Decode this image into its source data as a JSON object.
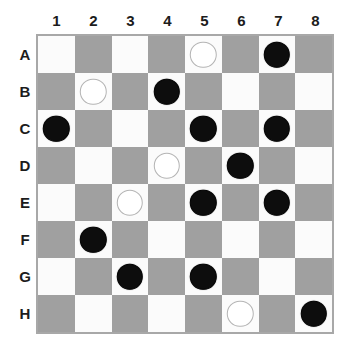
{
  "board": {
    "title": "Checkers Board",
    "column_labels": [
      "1",
      "2",
      "3",
      "4",
      "5",
      "6",
      "7",
      "8"
    ],
    "row_labels": [
      "A",
      "B",
      "C",
      "D",
      "E",
      "F",
      "G",
      "H"
    ],
    "size": 8,
    "colors": {
      "light_square": "#fbfbfb",
      "dark_square": "#a0a0a0",
      "border": "#a8a8a8",
      "black_piece": "#0d0d0d",
      "white_piece": "#ffffff",
      "white_piece_outline": "#b4b4b4",
      "label_text": "#1c1c1c",
      "background": "#ffffff"
    },
    "square_pattern_note": "A1 is light; light squares where (row+col) is even with 0-based indices",
    "pieces": [
      {
        "row": "A",
        "col": "5",
        "color": "white"
      },
      {
        "row": "A",
        "col": "7",
        "color": "black"
      },
      {
        "row": "B",
        "col": "2",
        "color": "white"
      },
      {
        "row": "B",
        "col": "4",
        "color": "black"
      },
      {
        "row": "C",
        "col": "1",
        "color": "black"
      },
      {
        "row": "C",
        "col": "5",
        "color": "black"
      },
      {
        "row": "C",
        "col": "7",
        "color": "black"
      },
      {
        "row": "D",
        "col": "4",
        "color": "white"
      },
      {
        "row": "D",
        "col": "6",
        "color": "black"
      },
      {
        "row": "E",
        "col": "3",
        "color": "white"
      },
      {
        "row": "E",
        "col": "5",
        "color": "black"
      },
      {
        "row": "E",
        "col": "7",
        "color": "black"
      },
      {
        "row": "F",
        "col": "2",
        "color": "black"
      },
      {
        "row": "G",
        "col": "3",
        "color": "black"
      },
      {
        "row": "G",
        "col": "5",
        "color": "black"
      },
      {
        "row": "H",
        "col": "6",
        "color": "white"
      },
      {
        "row": "H",
        "col": "8",
        "color": "black"
      }
    ],
    "counts": {
      "black_pieces": "12",
      "white_pieces": "5",
      "total_pieces": "17"
    }
  }
}
